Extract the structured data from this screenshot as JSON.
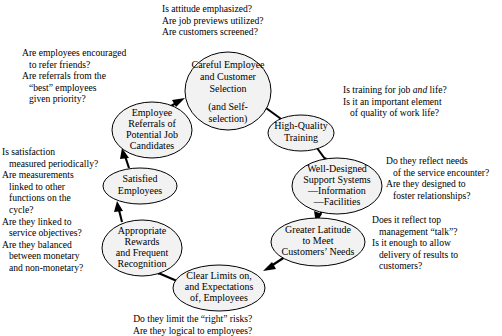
{
  "diagram": {
    "type": "cycle-flow-diagram",
    "colors": {
      "node_fill": "#f2f2f2",
      "node_stroke": "#000000",
      "arrow": "#000000",
      "text": "#000000",
      "background": "#ffffff"
    },
    "nodes": [
      {
        "id": "careful-selection",
        "lines": [
          "Careful Employee",
          "and Customer",
          "Selection",
          "",
          "(and Self-",
          "selection)"
        ]
      },
      {
        "id": "high-quality-training",
        "lines": [
          "High-Quality",
          "Training"
        ]
      },
      {
        "id": "support-systems",
        "lines": [
          "Well-Designed",
          "Support Systems",
          "—Information",
          "—Facilities"
        ]
      },
      {
        "id": "greater-latitude",
        "lines": [
          "Greater Latitude",
          "to Meet",
          "Customers’ Needs"
        ]
      },
      {
        "id": "clear-limits",
        "lines": [
          "Clear Limits on,",
          "and Expectations",
          "of, Employees"
        ]
      },
      {
        "id": "appropriate-rewards",
        "lines": [
          "Appropriate",
          "Rewards",
          "and Frequent",
          "Recognition"
        ]
      },
      {
        "id": "satisfied-employees",
        "lines": [
          "Satisfied",
          "Employees"
        ]
      },
      {
        "id": "employee-referrals",
        "lines": [
          "Employee",
          "Referrals of",
          "Potential Job",
          "Candidates"
        ]
      }
    ],
    "annotations": {
      "selection": {
        "id": "annotation-selection",
        "lines": [
          "Is attitude emphasized?",
          "Are job previews utilized?",
          "Are customers screened?"
        ]
      },
      "training": {
        "id": "annotation-training",
        "lines_html": [
          "Is training for job <i>and</i> life?",
          "Is it an important element",
          "of quality of work life?"
        ],
        "indent_flags": [
          false,
          false,
          true
        ]
      },
      "support": {
        "id": "annotation-support",
        "lines": [
          "Do they reflect needs",
          "of the service encounter?",
          "Are they designed to",
          "foster relationships?"
        ],
        "indent_flags": [
          false,
          true,
          false,
          true
        ]
      },
      "latitude": {
        "id": "annotation-latitude",
        "lines": [
          "Does it reflect top",
          "management “talk”?",
          "Is it enough to allow",
          "delivery of results to",
          "customers?"
        ],
        "indent_flags": [
          false,
          true,
          false,
          true,
          true
        ]
      },
      "limits": {
        "id": "annotation-limits",
        "lines": [
          "Do they limit the “right” risks?",
          "Are they logical to employees?"
        ]
      },
      "rewards": {
        "id": "annotation-rewards",
        "lines": [
          "Is satisfaction",
          "measured periodically?",
          "Are measurements",
          "linked to other",
          "functions on the",
          "cycle?",
          "Are they linked to",
          "service objectives?",
          "Are they balanced",
          "between monetary",
          "and non-monetary?"
        ],
        "indent_flags": [
          false,
          true,
          false,
          true,
          true,
          true,
          false,
          true,
          false,
          true,
          true
        ]
      },
      "referrals": {
        "id": "annotation-referrals",
        "lines": [
          "Are employees encouraged",
          "to refer friends?",
          "Are referrals from the",
          "“best” employees",
          "given priority?"
        ],
        "indent_flags": [
          false,
          true,
          false,
          true,
          true
        ]
      }
    }
  }
}
